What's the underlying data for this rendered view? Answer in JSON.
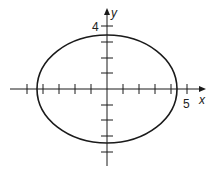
{
  "diagram": {
    "type": "ellipse-on-axes",
    "x_axis": {
      "label": "x",
      "tick_label": "5",
      "tick_count_left": 5,
      "tick_count_right": 5
    },
    "y_axis": {
      "label": "y",
      "tick_label": "4",
      "tick_count_up": 4,
      "tick_count_down": 4
    },
    "ellipse": {
      "center": [
        0,
        0
      ],
      "semi_major_x": 4.4,
      "semi_minor_y": 3.4
    },
    "colors": {
      "stroke": "#1a1a1a",
      "background": "#ffffff"
    }
  }
}
